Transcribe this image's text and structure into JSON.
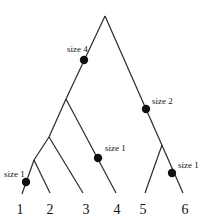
{
  "diagram": {
    "type": "phylogenetic-tree",
    "colors": {
      "line": "#2a2a2a",
      "dot": "#111111",
      "text": "#111111",
      "background": "#ffffff"
    },
    "nodes": {
      "root": {
        "x": 105,
        "y": 16
      },
      "n_left": {
        "x": 66,
        "y": 99
      },
      "n_123": {
        "x": 49,
        "y": 137
      },
      "n_12": {
        "x": 34,
        "y": 160
      },
      "n_56": {
        "x": 162,
        "y": 145
      }
    },
    "leaves": [
      {
        "label": "1",
        "x": 22,
        "y": 194,
        "label_x": 20,
        "label_y": 212
      },
      {
        "label": "2",
        "x": 50,
        "y": 193,
        "label_x": 50,
        "label_y": 212
      },
      {
        "label": "3",
        "x": 83,
        "y": 193,
        "label_x": 86,
        "label_y": 212
      },
      {
        "label": "4",
        "x": 116,
        "y": 193,
        "label_x": 117,
        "label_y": 212
      },
      {
        "label": "5",
        "x": 145,
        "y": 193,
        "label_x": 143,
        "label_y": 212
      },
      {
        "label": "6",
        "x": 183,
        "y": 193,
        "label_x": 185,
        "label_y": 212
      }
    ],
    "annotations": [
      {
        "label": "size 4",
        "dot_x": 84,
        "dot_y": 60,
        "text_x": 67,
        "text_y": 52
      },
      {
        "label": "size 2",
        "dot_x": 146,
        "dot_y": 109,
        "text_x": 152,
        "text_y": 104
      },
      {
        "label": "size 1",
        "dot_x": 98,
        "dot_y": 158,
        "text_x": 105,
        "text_y": 151
      },
      {
        "label": "size 1",
        "dot_x": 26,
        "dot_y": 182,
        "text_x": 10,
        "text_y": 177
      },
      {
        "label": "size 1",
        "dot_x": 172,
        "dot_y": 173,
        "text_x": 178,
        "text_y": 168
      }
    ]
  }
}
